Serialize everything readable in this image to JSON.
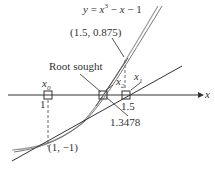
{
  "equation": {
    "prefix": "y = x",
    "exp": "3",
    "suffix": " − x − 1"
  },
  "labels": {
    "tangent_point_upper": "(1.5, 0.875)",
    "root_sought": "Root sought",
    "x0": "x",
    "x0_sub": "0",
    "x1": "x",
    "x1_sub": "1",
    "x2": "x",
    "x2_sub": "2",
    "tick_1": "1",
    "tick_1_5": "1.5",
    "root_value": "1.3478",
    "tangent_point_lower": "(1, −1)",
    "axis_x": "x"
  },
  "colors": {
    "curve": "#888888",
    "line": "#333333",
    "axis": "#333333"
  }
}
